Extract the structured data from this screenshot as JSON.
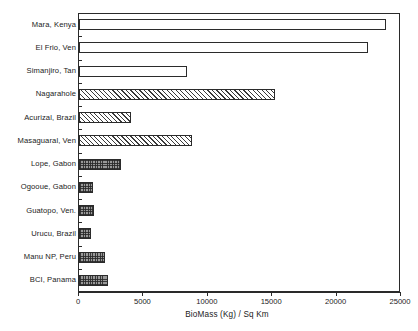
{
  "chart_data": {
    "type": "bar",
    "orientation": "horizontal",
    "title": "",
    "xlabel": "BioMass (Kg) / Sq Km",
    "ylabel": "",
    "xlim": [
      0,
      25000
    ],
    "xticks": [
      0,
      5000,
      10000,
      15000,
      20000,
      25000
    ],
    "xtick_labels": [
      "0",
      "5000",
      "10000",
      "15000",
      "20000",
      "25000"
    ],
    "grid": false,
    "legend": null,
    "categories": [
      "Mara, Kenya",
      "El Frio, Ven",
      "Simanjiro, Tan",
      "Nagarahole",
      "Acurizal, Brazil",
      "Masaguaral, Ven",
      "Lope, Gabon",
      "Ogooue, Gabon",
      "Guatopo, Ven.",
      "Urucu, Brazil",
      "Manu NP, Peru",
      "BCI, Panama"
    ],
    "values": [
      23800,
      22450,
      8350,
      15250,
      4050,
      8750,
      3250,
      1100,
      1150,
      950,
      2000,
      2250
    ],
    "bar_styles": [
      "open",
      "open",
      "open",
      "hatch",
      "hatch",
      "hatch",
      "check",
      "check",
      "check",
      "check",
      "check",
      "check"
    ],
    "style_colors": {
      "outline": "#2b2b2b",
      "open_fill": "#ffffff",
      "hatch_line": "#3a3a3a",
      "check_fill": "#9a9a9a",
      "axis": "#2a2a2a",
      "text": "#1a1a1a"
    }
  }
}
